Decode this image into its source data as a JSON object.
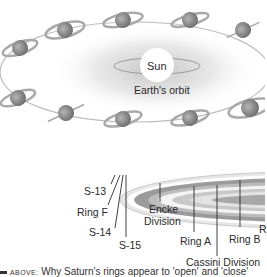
{
  "figure": {
    "top_diagram": {
      "center_label": "Sun",
      "orbit_label": "Earth's orbit",
      "planet": "Saturn",
      "planet_positions": 12
    },
    "ring_diagram": {
      "labels": {
        "s13": "S-13",
        "ring_f": "Ring F",
        "s14": "S-14",
        "s15": "S-15",
        "encke_line1": "Encke",
        "encke_line2": "Division",
        "ring_a": "Ring A",
        "ring_b": "Ring B",
        "cassini": "Cassini Division",
        "ring_c_partial": "R"
      }
    },
    "caption": {
      "prefix": "ABOVE:",
      "text": "Why Saturn's rings appear to 'open' and 'close'"
    }
  },
  "colors": {
    "ink": "#2a2a2a",
    "planet_gray": "#8c8c8c",
    "ring_light": "#d8d8d8",
    "glow": "#cfcfcf"
  }
}
